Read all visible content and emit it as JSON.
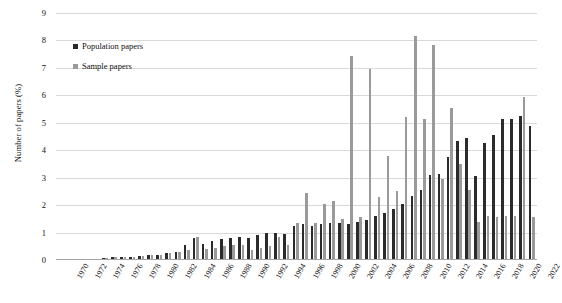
{
  "chart_data": {
    "type": "bar",
    "title": "",
    "subtitle": "",
    "xlabel": "",
    "ylabel": "Number of papers (%)",
    "ylim": [
      0,
      9
    ],
    "ytick_step": 1,
    "yticks": [
      0,
      1,
      2,
      3,
      4,
      5,
      6,
      7,
      8,
      9
    ],
    "grid": true,
    "legend_position": "inside-top-left",
    "xtick_step": 2,
    "x_first_label": 1970,
    "x_last_label": 2022,
    "categories": [
      1970,
      1971,
      1972,
      1973,
      1974,
      1975,
      1976,
      1977,
      1978,
      1979,
      1980,
      1981,
      1982,
      1983,
      1984,
      1985,
      1986,
      1987,
      1988,
      1989,
      1990,
      1991,
      1992,
      1993,
      1994,
      1995,
      1996,
      1997,
      1998,
      1999,
      2000,
      2001,
      2002,
      2003,
      2004,
      2005,
      2006,
      2007,
      2008,
      2009,
      2010,
      2011,
      2012,
      2013,
      2014,
      2015,
      2016,
      2017,
      2018,
      2019,
      2020,
      2021,
      2022
    ],
    "xtick_labels": [
      "1970",
      "1972",
      "1974",
      "1976",
      "1978",
      "1980",
      "1982",
      "1984",
      "1986",
      "1988",
      "1990",
      "1992",
      "1994",
      "1996",
      "1998",
      "2000",
      "2002",
      "2004",
      "2006",
      "2008",
      "2010",
      "2012",
      "2014",
      "2016",
      "2018",
      "2020",
      "2022"
    ],
    "series": [
      {
        "name": "Population papers",
        "color": "#2b2b2b",
        "values": [
          0.05,
          0.05,
          0.05,
          0.05,
          0.05,
          0.08,
          0.1,
          0.1,
          0.12,
          0.15,
          0.18,
          0.2,
          0.25,
          0.3,
          0.55,
          0.8,
          0.6,
          0.7,
          0.75,
          0.8,
          0.85,
          0.8,
          0.9,
          1.0,
          1.0,
          0.95,
          1.25,
          1.3,
          1.25,
          1.3,
          1.35,
          1.35,
          1.3,
          1.4,
          1.45,
          1.6,
          1.7,
          1.85,
          2.05,
          2.35,
          2.55,
          3.1,
          3.15,
          3.75,
          4.35,
          4.45,
          3.05,
          4.25,
          4.55,
          5.15,
          5.15,
          5.25,
          4.9
        ]
      },
      {
        "name": "Sample papers",
        "color": "#9a9a9a",
        "values": [
          0.05,
          0.05,
          0.05,
          0.05,
          0.05,
          0.08,
          0.1,
          0.1,
          0.12,
          0.15,
          0.18,
          0.2,
          0.25,
          0.3,
          0.35,
          0.85,
          0.4,
          0.45,
          0.5,
          0.55,
          0.55,
          0.35,
          0.45,
          0.5,
          0.85,
          0.55,
          1.35,
          2.45,
          1.35,
          2.05,
          2.15,
          1.5,
          7.45,
          1.55,
          6.95,
          2.3,
          3.8,
          2.5,
          5.2,
          8.15,
          5.15,
          7.85,
          2.95,
          5.55,
          3.5,
          2.55,
          1.4,
          1.6,
          1.55,
          1.6,
          1.6,
          5.95,
          1.55
        ]
      }
    ]
  },
  "legend": {
    "items": [
      {
        "label": "Population papers",
        "color": "#2b2b2b"
      },
      {
        "label": "Sample papers",
        "color": "#9a9a9a"
      }
    ]
  },
  "axes": {
    "y_title": "Number of papers (%)"
  }
}
